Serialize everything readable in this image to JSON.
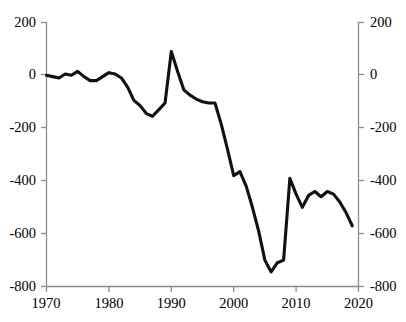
{
  "chart_data": {
    "type": "line",
    "title": "",
    "subtitle": "",
    "xlabel": "",
    "ylabel": "",
    "xlim": [
      1970,
      2020
    ],
    "ylim": [
      -800,
      200
    ],
    "grid": false,
    "legend": false,
    "line_color": "#111111",
    "axis_color": "#8c8c8c",
    "y_ticks_left": [
      "200",
      "0",
      "-200",
      "-400",
      "-600",
      "-800"
    ],
    "y_ticks_right": [
      "200",
      "0",
      "-200",
      "-400",
      "-600",
      "-800"
    ],
    "y_tick_values": [
      200,
      0,
      -200,
      -400,
      -600,
      -800
    ],
    "x_ticks": [
      "1970",
      "1980",
      "1990",
      "2000",
      "2010",
      "2020"
    ],
    "x_tick_values": [
      1970,
      1980,
      1990,
      2000,
      2010,
      2020
    ],
    "series": [
      {
        "name": "series-1",
        "x": [
          1970,
          1971,
          1972,
          1973,
          1974,
          1975,
          1976,
          1977,
          1978,
          1979,
          1980,
          1981,
          1982,
          1983,
          1984,
          1985,
          1986,
          1987,
          1988,
          1989,
          1990,
          1991,
          1992,
          1993,
          1994,
          1995,
          1996,
          1997,
          1998,
          1999,
          2000,
          2001,
          2002,
          2003,
          2004,
          2005,
          2006,
          2007,
          2008,
          2009,
          2010,
          2011,
          2012,
          2013,
          2014,
          2015,
          2016,
          2017,
          2018,
          2019
        ],
        "values": [
          0,
          -5,
          -10,
          5,
          0,
          15,
          -5,
          -20,
          -20,
          -5,
          10,
          5,
          -10,
          -45,
          -95,
          -115,
          -145,
          -155,
          -130,
          -105,
          90,
          15,
          -55,
          -75,
          -90,
          -100,
          -105,
          -105,
          -185,
          -280,
          -380,
          -365,
          -420,
          -500,
          -590,
          -700,
          -745,
          -710,
          -700,
          -390,
          -450,
          -500,
          -455,
          -440,
          -460,
          -440,
          -450,
          -480,
          -520,
          -570
        ]
      }
    ]
  },
  "axes": {
    "left": {
      "ticks": [
        {
          "label": "200"
        },
        {
          "label": "0"
        },
        {
          "label": "-200"
        },
        {
          "label": "-400"
        },
        {
          "label": "-600"
        },
        {
          "label": "-800"
        }
      ]
    },
    "right": {
      "ticks": [
        {
          "label": "200"
        },
        {
          "label": "0"
        },
        {
          "label": "-200"
        },
        {
          "label": "-400"
        },
        {
          "label": "-600"
        },
        {
          "label": "-800"
        }
      ]
    },
    "bottom": {
      "ticks": [
        {
          "label": "1970"
        },
        {
          "label": "1980"
        },
        {
          "label": "1990"
        },
        {
          "label": "2000"
        },
        {
          "label": "2010"
        },
        {
          "label": "2020"
        }
      ]
    }
  }
}
